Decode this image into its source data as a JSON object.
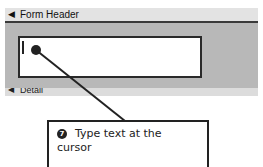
{
  "form": {
    "header_section_label": "Form Header",
    "header_icon": "section-arrow-icon",
    "detail_section_label": "Detail",
    "detail_icon": "section-arrow-icon",
    "textbox_value": ""
  },
  "callout": {
    "step_number": "7",
    "text": "Type text at the cursor"
  },
  "colors": {
    "section_background": "#b8b8b8",
    "bar_background": "#e3e3e3",
    "line": "#222222"
  }
}
